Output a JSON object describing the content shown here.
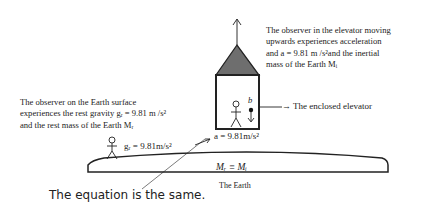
{
  "diagram": {
    "elevator_note": {
      "line1": "The observer in the elevator moving",
      "line2": "upwards experiences acceleration",
      "line3": "and a = 9.81 m /s²and the inertial",
      "line4": "mass of the Earth  Mᵢ"
    },
    "earth_note": {
      "line1": "The   observer   on   the   Earth   surface",
      "line2": "experiences the rest gravity gᵣ = 9.81 m /s²",
      "line3": "and the rest mass of the Earth  Mᵣ"
    },
    "elevator_label": "→ The enclosed elevator",
    "elevator_accel": "a = 9.81m/s²",
    "ball_label": "b",
    "rest_gravity": "gᵣ = 9.81m/s²",
    "mass_equivalence": "Mᵣ ≡ Mᵢ",
    "earth_label": "The Earth",
    "equation_caption": "The equation is the same.",
    "colors": {
      "roof_fill": "#6e6e6e",
      "stroke": "#222222"
    }
  }
}
